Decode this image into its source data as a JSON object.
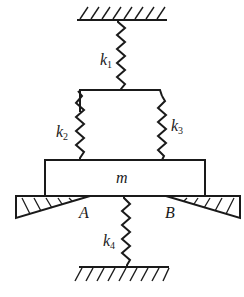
{
  "diagram": {
    "type": "spring-mass system",
    "colors": {
      "line": "#1a1a1a",
      "background": "#ffffff"
    },
    "mass": {
      "label": "m"
    },
    "springs": [
      {
        "id": "k1",
        "symbol": "k",
        "subscript": "1"
      },
      {
        "id": "k2",
        "symbol": "k",
        "subscript": "2"
      },
      {
        "id": "k3",
        "symbol": "k",
        "subscript": "3"
      },
      {
        "id": "k4",
        "symbol": "k",
        "subscript": "4"
      }
    ],
    "supports": [
      {
        "id": "A",
        "label": "A"
      },
      {
        "id": "B",
        "label": "B"
      }
    ],
    "grounds": [
      "top-ceiling",
      "bottom-floor"
    ]
  }
}
